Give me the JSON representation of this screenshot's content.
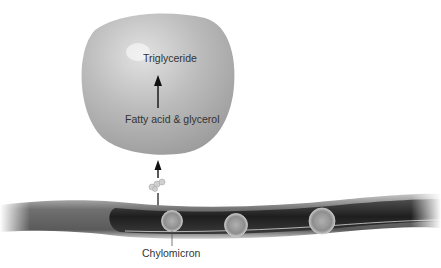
{
  "diagram": {
    "labels": {
      "top": "Triglyceride",
      "middle": "Fatty acid & glycerol",
      "bottom": "Chylomicron"
    },
    "colors": {
      "globule": "#b8b8b8",
      "vessel_dark": "#3a3a3a",
      "vessel_outer": "#8a8a8a",
      "chylomicron": "#9a9a9a",
      "arrow": "#111111"
    }
  }
}
